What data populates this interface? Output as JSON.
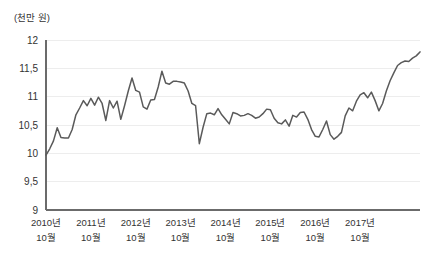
{
  "chart_data": {
    "type": "line",
    "title": "",
    "subtitle": "",
    "unit_label": "(천만 원)",
    "xlabel": "",
    "ylabel": "",
    "ylim": [
      9,
      12
    ],
    "yticks": [
      9,
      9.5,
      10,
      10.5,
      11,
      11.5,
      12
    ],
    "ytick_labels": [
      "9",
      "9,5",
      "10",
      "10,5",
      "11",
      "11,5",
      "12"
    ],
    "grid": true,
    "legend": "none",
    "decimal_separator": ",",
    "x_major_labels": [
      {
        "year": "2010년",
        "month": "10월"
      },
      {
        "year": "2011년",
        "month": "10월"
      },
      {
        "year": "2012년",
        "month": "10월"
      },
      {
        "year": "2013년",
        "month": "10월"
      },
      {
        "year": "2014년",
        "month": "10월"
      },
      {
        "year": "2015년",
        "month": "10월"
      },
      {
        "year": "2016년",
        "month": "10월"
      },
      {
        "year": "2017년",
        "month": "10월"
      }
    ],
    "x_start": "2010년 10월",
    "x_end": "2017년 12월",
    "series": [
      {
        "name": "지수",
        "color": "#5a5a5a",
        "values": [
          9.97,
          10.08,
          10.22,
          10.45,
          10.28,
          10.27,
          10.27,
          10.42,
          10.68,
          10.8,
          10.93,
          10.84,
          10.97,
          10.85,
          10.99,
          10.88,
          10.58,
          10.93,
          10.8,
          10.92,
          10.6,
          10.84,
          11.1,
          11.33,
          11.11,
          11.08,
          10.82,
          10.78,
          10.94,
          10.95,
          11.17,
          11.45,
          11.24,
          11.22,
          11.27,
          11.27,
          11.26,
          11.24,
          11.1,
          10.88,
          10.84,
          10.17,
          10.46,
          10.7,
          10.71,
          10.68,
          10.79,
          10.68,
          10.6,
          10.52,
          10.72,
          10.7,
          10.66,
          10.67,
          10.7,
          10.67,
          10.62,
          10.64,
          10.7,
          10.78,
          10.77,
          10.62,
          10.54,
          10.52,
          10.59,
          10.48,
          10.67,
          10.64,
          10.72,
          10.73,
          10.6,
          10.42,
          10.3,
          10.29,
          10.42,
          10.57,
          10.33,
          10.25,
          10.3,
          10.37,
          10.66,
          10.8,
          10.75,
          10.92,
          11.03,
          11.07,
          10.98,
          11.08,
          10.93,
          10.75,
          10.88,
          11.1,
          11.28,
          11.42,
          11.55,
          11.6,
          11.63,
          11.62,
          11.68,
          11.72,
          11.79
        ]
      }
    ]
  },
  "axes": {
    "plot_left": 46,
    "plot_right": 420,
    "plot_top": 40,
    "plot_bottom": 210
  }
}
